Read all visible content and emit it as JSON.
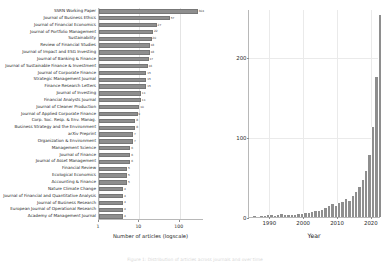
{
  "caption": {
    "text": "Figure 1: Distribution of articles across journals and over time"
  },
  "chart_data": [
    {
      "type": "bar",
      "orientation": "horizontal",
      "title": "",
      "xlabel": "Number of articles (logscale)",
      "ylabel": "",
      "xscale": "log",
      "xlim": [
        1,
        400
      ],
      "xticks": [
        "1",
        "10",
        "100"
      ],
      "xtick_values": [
        1,
        10,
        100
      ],
      "grid": true,
      "categories": [
        "SSRN Working Paper",
        "Journal of Business Ethics",
        "Journal of Financial Economics",
        "Journal of Portfolio Management",
        "Sustainability",
        "Review of Financial Studies",
        "Journal of Impact and ESG Investing",
        "Journal of Banking & Finance",
        "Journal of Sustainable Finance & Investment",
        "Journal of Corporate Finance",
        "Strategic Management Journal",
        "Finance Research Letters",
        "Journal of Investing",
        "Financial Analysts Journal",
        "Journal of Cleaner Production",
        "Journal of Applied Corporate Finance",
        "Corp. Soc. Resp. & Env. Manag.",
        "Business Strategy and the Environment",
        "arXiv Preprint",
        "Organization & Environment",
        "Management Science",
        "Journal of Finance",
        "Journal of Asset Management",
        "Financial Review",
        "Ecological Economics",
        "Accounting & Finance",
        "Nature Climate Change",
        "Journal of Financial and Quantitative Analysis",
        "Journal of Business Research",
        "European Journal of Operational Research",
        "Academy of Management Journal"
      ],
      "values": [
        304,
        57,
        27,
        22,
        20,
        18,
        18,
        17,
        16,
        15,
        15,
        15,
        11,
        11,
        10,
        9,
        8,
        8,
        7,
        7,
        6,
        6,
        6,
        5,
        5,
        5,
        4,
        4,
        4,
        4,
        4
      ],
      "value_labels": [
        "304",
        "57",
        "27",
        "22",
        "20",
        "18",
        "18",
        "17",
        "16",
        "15",
        "15",
        "15",
        "11",
        "11",
        "10",
        "9",
        "8",
        "8",
        "7",
        "7",
        "6",
        "6",
        "6",
        "5",
        "5",
        "5",
        "4",
        "4",
        "4",
        "4",
        "4"
      ],
      "bar_color": "#8e8e8e"
    },
    {
      "type": "bar",
      "subtype": "histogram",
      "title": "",
      "xlabel": "Year",
      "ylabel": "",
      "xlim": [
        1984,
        2023
      ],
      "ylim": [
        0,
        260
      ],
      "xticks": [
        "1990",
        "2000",
        "2010",
        "2020"
      ],
      "xtick_values": [
        1990,
        2000,
        2010,
        2020
      ],
      "yticks": [
        "0",
        "100",
        "200"
      ],
      "ytick_values": [
        0,
        100,
        200
      ],
      "grid": true,
      "bar_color": "#8e8e8e",
      "x": [
        1985,
        1986,
        1987,
        1988,
        1989,
        1990,
        1991,
        1992,
        1993,
        1994,
        1995,
        1996,
        1997,
        1998,
        1999,
        2000,
        2001,
        2002,
        2003,
        2004,
        2005,
        2006,
        2007,
        2008,
        2009,
        2010,
        2011,
        2012,
        2013,
        2014,
        2015,
        2016,
        2017,
        2018,
        2019,
        2020,
        2021,
        2022
      ],
      "values": [
        1,
        0,
        1,
        1,
        2,
        2,
        1,
        2,
        4,
        3,
        2,
        3,
        3,
        4,
        4,
        5,
        5,
        6,
        7,
        8,
        9,
        11,
        14,
        16,
        14,
        17,
        19,
        22,
        20,
        26,
        31,
        37,
        46,
        58,
        78,
        112,
        175,
        252
      ]
    }
  ]
}
